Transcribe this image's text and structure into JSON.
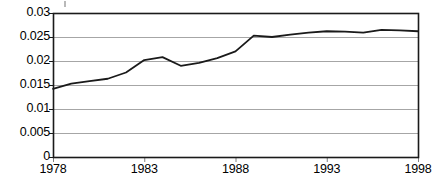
{
  "chart_data": {
    "type": "line",
    "title": "",
    "subtitle": "",
    "xlabel": "",
    "ylabel": "",
    "x": [
      1978,
      1979,
      1980,
      1981,
      1982,
      1983,
      1984,
      1985,
      1986,
      1987,
      1988,
      1989,
      1990,
      1991,
      1992,
      1993,
      1994,
      1995,
      1996,
      1997,
      1998
    ],
    "series": [
      {
        "name": "series-1",
        "values": [
          0.0142,
          0.0153,
          0.0158,
          0.0163,
          0.0176,
          0.0202,
          0.0208,
          0.019,
          0.0196,
          0.0206,
          0.022,
          0.0253,
          0.025,
          0.0255,
          0.0259,
          0.0262,
          0.0261,
          0.0259,
          0.0265,
          0.0264,
          0.0262
        ],
        "color": "#1a1a1a"
      }
    ],
    "xlim": [
      1978,
      1998
    ],
    "ylim": [
      0,
      0.03
    ],
    "ytick_values": [
      0,
      0.005,
      0.01,
      0.015,
      0.02,
      0.025,
      0.03
    ],
    "ytick_labels": [
      "0",
      "0.005",
      "0.01",
      "0.015",
      "0.02",
      "0.025",
      "0.03"
    ],
    "xtick_values": [
      1978,
      1983,
      1988,
      1993,
      1998
    ],
    "xtick_labels": [
      "1978",
      "1983",
      "1988",
      "1993",
      "1998"
    ],
    "grid": {
      "horizontal": true,
      "vertical": false,
      "color": "#a6a6a6"
    },
    "legend": {
      "visible": false,
      "position": "none",
      "entries": []
    },
    "annotations": [],
    "plot_area": {
      "left": 53,
      "top": 13,
      "right": 418,
      "bottom": 157
    },
    "style": {
      "background": "#ffffff",
      "axis_color": "#1a1a1a",
      "line_width": 1.8,
      "tick_color": "#808080"
    }
  }
}
